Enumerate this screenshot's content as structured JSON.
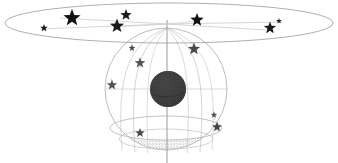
{
  "figure": {
    "kind": "celestial-sphere-diagram",
    "width": 338,
    "height": 163,
    "background_color": "#ffffff",
    "title": "",
    "caption": ""
  },
  "colors": {
    "background": "#ffffff",
    "outline_light": "#b9b9b9",
    "outline_mid": "#9a9a9a",
    "outline_dark": "#7d7d7d",
    "star_fill": "#1a1a1a",
    "star_fill_soft": "#444444",
    "central_body_fill": "#3a3a3a",
    "central_body_texture": "#555555",
    "cap_shade": "#f0f0f0",
    "cap_speckle": "#c9c9c9",
    "trail_line": "#bdbdbd"
  },
  "elements": {
    "disk_plane": {
      "name": "galactic-plane-disk",
      "center_x": 169,
      "center_y": 23,
      "radius_x": 164,
      "radius_y": 20,
      "stroke": "#9a9a9a",
      "stroke_width": 0.8
    },
    "celestial_sphere": {
      "name": "celestial-sphere",
      "center_x": 166,
      "center_y": 89,
      "radius": 61,
      "stroke": "#b5b5b5",
      "stroke_width": 0.9
    },
    "polar_axis": {
      "name": "polar-axis",
      "x": 167,
      "y_top": 22,
      "y_bottom": 163,
      "stroke": "#8f8f8f",
      "stroke_width": 0.9
    },
    "equator_line": {
      "name": "sphere-equator-chord",
      "y": 89,
      "x_start": 106,
      "x_end": 228,
      "stroke": "#c3c3c3",
      "stroke_width": 0.7
    },
    "central_body": {
      "name": "central-body",
      "center_x": 168,
      "center_y": 89,
      "radius": 18,
      "fill": "#3a3a3a"
    },
    "bottom_cap": {
      "name": "shaded-bottom-cap",
      "center_x": 166,
      "center_y": 128,
      "radius_x": 56,
      "radius_y": 12,
      "fill": "#f2f2f2",
      "stroke": "#b5b5b5"
    },
    "lower_cap_rim": {
      "name": "lower-cap-rim",
      "center_x": 166,
      "center_y": 138,
      "radius_x": 48,
      "radius_y": 10,
      "stroke": "#c0c0c0"
    }
  },
  "meridian_arcs": [
    {
      "name": "meridian-arc-1",
      "d": "M 167 28 C 126 44 118 76 122 149",
      "stroke": "#cfcfcf"
    },
    {
      "name": "meridian-arc-2",
      "d": "M 167 28 C 137 46 131 78 136 152",
      "stroke": "#cccccc"
    },
    {
      "name": "meridian-arc-3",
      "d": "M 167 28 C 149 48 146 80 149 153",
      "stroke": "#d2d2d2"
    },
    {
      "name": "meridian-arc-4",
      "d": "M 167 28 C 186 48 190 80 187 153",
      "stroke": "#cfcfcf"
    },
    {
      "name": "meridian-arc-5",
      "d": "M 167 28 C 198 46 205 78 200 152",
      "stroke": "#cccccc"
    },
    {
      "name": "meridian-arc-6",
      "d": "M 167 28 C 208 44 216 76 212 149",
      "stroke": "#d2d2d2"
    }
  ],
  "plane_trails": [
    {
      "name": "plane-trail-left-outer",
      "d": "M 167 24 L 40 29",
      "stroke": "#c4c4c4"
    },
    {
      "name": "plane-trail-left-inner",
      "d": "M 167 24 L 58 18",
      "stroke": "#c4c4c4"
    },
    {
      "name": "plane-trail-left-mid",
      "d": "M 167 24 L 116 26",
      "stroke": "#c9c9c9"
    },
    {
      "name": "plane-trail-right-outer",
      "d": "M 167 24 L 280 22",
      "stroke": "#c4c4c4"
    },
    {
      "name": "plane-trail-right-inner",
      "d": "M 167 24 L 268 29",
      "stroke": "#c4c4c4"
    },
    {
      "name": "plane-trail-right-mid",
      "d": "M 167 24 L 196 21",
      "stroke": "#c9c9c9"
    }
  ],
  "stars": [
    {
      "name": "star-plane-1",
      "x": 44,
      "y": 28,
      "size": 4.0,
      "fill": "#1a1a1a",
      "label": ""
    },
    {
      "name": "star-plane-2",
      "x": 72,
      "y": 18,
      "size": 9.0,
      "fill": "#111111",
      "label": ""
    },
    {
      "name": "star-plane-3",
      "x": 117,
      "y": 26,
      "size": 7.5,
      "fill": "#1a1a1a",
      "label": ""
    },
    {
      "name": "star-plane-4",
      "x": 126,
      "y": 15,
      "size": 6.0,
      "fill": "#1a1a1a",
      "label": ""
    },
    {
      "name": "star-plane-5",
      "x": 197,
      "y": 20,
      "size": 7.0,
      "fill": "#111111",
      "label": ""
    },
    {
      "name": "star-plane-6",
      "x": 270,
      "y": 28,
      "size": 6.5,
      "fill": "#1a1a1a",
      "label": ""
    },
    {
      "name": "star-plane-7",
      "x": 279,
      "y": 21,
      "size": 3.0,
      "fill": "#222222",
      "label": ""
    },
    {
      "name": "star-sphere-1",
      "x": 132,
      "y": 48,
      "size": 3.6,
      "fill": "#4a4a4a",
      "label": ""
    },
    {
      "name": "star-sphere-2",
      "x": 140,
      "y": 63,
      "size": 5.6,
      "fill": "#555555",
      "label": ""
    },
    {
      "name": "star-sphere-3",
      "x": 112,
      "y": 85,
      "size": 5.4,
      "fill": "#4f4f4f",
      "label": ""
    },
    {
      "name": "star-sphere-4",
      "x": 194,
      "y": 49,
      "size": 6.4,
      "fill": "#4a4a4a",
      "label": ""
    },
    {
      "name": "star-sphere-5",
      "x": 214,
      "y": 115,
      "size": 3.4,
      "fill": "#4f4f4f",
      "label": ""
    },
    {
      "name": "star-sphere-6",
      "x": 217,
      "y": 127,
      "size": 5.2,
      "fill": "#444444",
      "label": ""
    },
    {
      "name": "star-sphere-7",
      "x": 140,
      "y": 133,
      "size": 5.0,
      "fill": "#4c4c4c",
      "label": ""
    }
  ],
  "star_trails": [
    {
      "name": "star-trail-sphere-1",
      "d": "M 132 44 L 134 54",
      "stroke": "#d5d5d5"
    },
    {
      "name": "star-trail-sphere-2",
      "d": "M 140 58 L 142 69",
      "stroke": "#d5d5d5"
    },
    {
      "name": "star-trail-sphere-3",
      "d": "M 112 79 L 113 91",
      "stroke": "#d5d5d5"
    },
    {
      "name": "star-trail-sphere-5",
      "d": "M 214 110 L 216 120",
      "stroke": "#d5d5d5"
    },
    {
      "name": "star-trail-sphere-6",
      "d": "M 217 122 L 219 133",
      "stroke": "#d5d5d5"
    }
  ]
}
